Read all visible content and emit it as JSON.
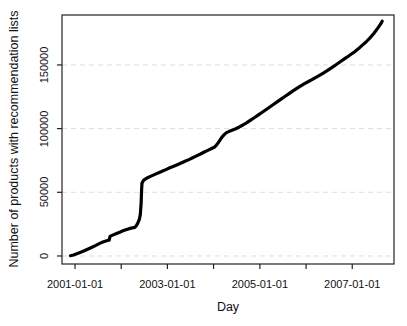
{
  "chart_data": {
    "type": "line",
    "title": "",
    "xlabel": "Day",
    "ylabel": "Number of products with recommendation lists",
    "line_color": "#000000",
    "line_width": 3.2,
    "grid": {
      "show": true,
      "style": "dashed",
      "color": "#dedede"
    },
    "axis_color": "#222222",
    "x_axis": {
      "range": [
        "2000-09-20",
        "2007-11-27"
      ],
      "ticks": [
        {
          "date": "2001-01-01",
          "label": "2001-01-01"
        },
        {
          "date": "2002-01-01",
          "label": ""
        },
        {
          "date": "2003-01-01",
          "label": "2003-01-01"
        },
        {
          "date": "2004-01-01",
          "label": ""
        },
        {
          "date": "2005-01-01",
          "label": "2005-01-01"
        },
        {
          "date": "2006-01-01",
          "label": ""
        },
        {
          "date": "2007-01-01",
          "label": "2007-01-01"
        }
      ]
    },
    "y_axis": {
      "range": [
        -6300,
        189200
      ],
      "ticks": [
        {
          "value": 0,
          "label": "0"
        },
        {
          "value": 50000,
          "label": "50000"
        },
        {
          "value": 100000,
          "label": "100000"
        },
        {
          "value": 150000,
          "label": "150000"
        }
      ]
    },
    "series": [
      {
        "name": "products-with-recommendation-lists",
        "points": [
          [
            "2000-11-25",
            200
          ],
          [
            "2000-12-20",
            800
          ],
          [
            "2001-01-15",
            1700
          ],
          [
            "2001-02-15",
            2900
          ],
          [
            "2001-03-15",
            4100
          ],
          [
            "2001-04-15",
            5500
          ],
          [
            "2001-05-15",
            6900
          ],
          [
            "2001-06-15",
            8300
          ],
          [
            "2001-07-15",
            9900
          ],
          [
            "2001-08-15",
            11200
          ],
          [
            "2001-09-20",
            12300
          ],
          [
            "2001-09-28",
            12500
          ],
          [
            "2001-10-04",
            15400
          ],
          [
            "2001-10-25",
            16400
          ],
          [
            "2001-11-20",
            17500
          ],
          [
            "2001-12-20",
            18700
          ],
          [
            "2002-01-20",
            19900
          ],
          [
            "2002-02-20",
            21000
          ],
          [
            "2002-03-20",
            21900
          ],
          [
            "2002-04-18",
            22400
          ],
          [
            "2002-04-28",
            23400
          ],
          [
            "2002-05-12",
            25800
          ],
          [
            "2002-05-24",
            28800
          ],
          [
            "2002-06-01",
            32500
          ],
          [
            "2002-06-07",
            41000
          ],
          [
            "2002-06-11",
            52000
          ],
          [
            "2002-06-14",
            57200
          ],
          [
            "2002-06-28",
            59600
          ],
          [
            "2002-07-20",
            61000
          ],
          [
            "2002-08-20",
            62500
          ],
          [
            "2002-09-20",
            63900
          ],
          [
            "2002-10-20",
            65200
          ],
          [
            "2002-11-20",
            66500
          ],
          [
            "2002-12-20",
            67800
          ],
          [
            "2003-01-20",
            69200
          ],
          [
            "2003-02-20",
            70500
          ],
          [
            "2003-03-20",
            71700
          ],
          [
            "2003-04-20",
            73000
          ],
          [
            "2003-05-20",
            74300
          ],
          [
            "2003-06-20",
            75700
          ],
          [
            "2003-07-20",
            77100
          ],
          [
            "2003-08-20",
            78600
          ],
          [
            "2003-09-20",
            80100
          ],
          [
            "2003-10-20",
            81600
          ],
          [
            "2003-11-20",
            83100
          ],
          [
            "2003-12-20",
            84600
          ],
          [
            "2004-01-10",
            85600
          ],
          [
            "2004-01-25",
            87200
          ],
          [
            "2004-02-10",
            89300
          ],
          [
            "2004-02-25",
            91600
          ],
          [
            "2004-03-10",
            93600
          ],
          [
            "2004-03-25",
            95300
          ],
          [
            "2004-04-10",
            96600
          ],
          [
            "2004-04-25",
            97400
          ],
          [
            "2004-05-20",
            98500
          ],
          [
            "2004-06-20",
            99700
          ],
          [
            "2004-07-20",
            101100
          ],
          [
            "2004-08-20",
            102800
          ],
          [
            "2004-09-20",
            104700
          ],
          [
            "2004-10-20",
            106700
          ],
          [
            "2004-11-20",
            108700
          ],
          [
            "2004-12-20",
            110800
          ],
          [
            "2005-01-20",
            112900
          ],
          [
            "2005-02-20",
            115000
          ],
          [
            "2005-03-20",
            117000
          ],
          [
            "2005-04-20",
            119100
          ],
          [
            "2005-05-20",
            121200
          ],
          [
            "2005-06-20",
            123300
          ],
          [
            "2005-07-20",
            125400
          ],
          [
            "2005-08-20",
            127500
          ],
          [
            "2005-09-20",
            129600
          ],
          [
            "2005-10-20",
            131600
          ],
          [
            "2005-11-20",
            133500
          ],
          [
            "2005-12-20",
            135300
          ],
          [
            "2006-01-20",
            137000
          ],
          [
            "2006-02-20",
            138600
          ],
          [
            "2006-03-20",
            140300
          ],
          [
            "2006-04-20",
            142000
          ],
          [
            "2006-05-20",
            143800
          ],
          [
            "2006-06-20",
            145700
          ],
          [
            "2006-07-20",
            147700
          ],
          [
            "2006-08-20",
            149800
          ],
          [
            "2006-09-20",
            151900
          ],
          [
            "2006-10-20",
            154000
          ],
          [
            "2006-11-20",
            156100
          ],
          [
            "2006-12-20",
            158200
          ],
          [
            "2007-01-20",
            160400
          ],
          [
            "2007-02-20",
            162800
          ],
          [
            "2007-03-20",
            165300
          ],
          [
            "2007-04-20",
            168000
          ],
          [
            "2007-05-20",
            171100
          ],
          [
            "2007-06-20",
            174700
          ],
          [
            "2007-07-20",
            178700
          ],
          [
            "2007-08-10",
            181700
          ],
          [
            "2007-08-26",
            184300
          ]
        ]
      }
    ]
  }
}
